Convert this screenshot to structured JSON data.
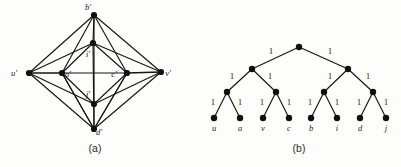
{
  "figure": {
    "panels": [
      {
        "id": "panel-a",
        "caption": "(a)",
        "type": "graph",
        "vertices": [
          {
            "id": "b'",
            "label": "b'",
            "x": 94,
            "y": 15,
            "label_x": 88,
            "label_y": 10
          },
          {
            "id": "i'",
            "label": "i'",
            "x": 93,
            "y": 43,
            "label_x": 88,
            "label_y": 57
          },
          {
            "id": "u'",
            "label": "u'",
            "x": 29,
            "y": 73,
            "label_x": 14,
            "label_y": 76
          },
          {
            "id": "a'",
            "label": "a'",
            "x": 62,
            "y": 73,
            "label_x": 68,
            "label_y": 77
          },
          {
            "id": "c'",
            "label": "c'",
            "x": 127,
            "y": 73,
            "label_x": 114,
            "label_y": 77
          },
          {
            "id": "v'",
            "label": "v'",
            "x": 161,
            "y": 72,
            "label_x": 168,
            "label_y": 76
          },
          {
            "id": "j'",
            "label": "j'",
            "x": 94,
            "y": 104,
            "label_x": 88,
            "label_y": 97
          },
          {
            "id": "d'",
            "label": "d'",
            "x": 94,
            "y": 129,
            "label_x": 99,
            "label_y": 135
          }
        ],
        "edges": [
          [
            "u'",
            "b'"
          ],
          [
            "u'",
            "d'"
          ],
          [
            "v'",
            "b'"
          ],
          [
            "v'",
            "d'"
          ],
          [
            "u'",
            "a'"
          ],
          [
            "a'",
            "c'"
          ],
          [
            "c'",
            "v'"
          ],
          [
            "u'",
            "i'"
          ],
          [
            "u'",
            "j'"
          ],
          [
            "v'",
            "i'"
          ],
          [
            "v'",
            "j'"
          ],
          [
            "b'",
            "i'"
          ],
          [
            "b'",
            "a'"
          ],
          [
            "b'",
            "c'"
          ],
          [
            "d'",
            "j'"
          ],
          [
            "d'",
            "a'"
          ],
          [
            "d'",
            "c'"
          ],
          [
            "i'",
            "a'"
          ],
          [
            "i'",
            "c'"
          ],
          [
            "j'",
            "a'"
          ],
          [
            "j'",
            "c'"
          ],
          [
            "a'",
            "d'"
          ],
          [
            "c'",
            "d'"
          ],
          [
            "b'",
            "j'"
          ],
          [
            "i'",
            "d'"
          ]
        ]
      },
      {
        "id": "panel-b",
        "caption": "(b)",
        "type": "tree",
        "edge_weight_label": "1",
        "nodes": [
          {
            "id": "root",
            "x": 299,
            "y": 47,
            "level": 0
          },
          {
            "id": "n-l",
            "x": 252,
            "y": 69,
            "level": 1
          },
          {
            "id": "n-r",
            "x": 348,
            "y": 69,
            "level": 1
          },
          {
            "id": "n-ll",
            "x": 227,
            "y": 92,
            "level": 2
          },
          {
            "id": "n-lr",
            "x": 276,
            "y": 92,
            "level": 2
          },
          {
            "id": "n-rl",
            "x": 324,
            "y": 92,
            "level": 2
          },
          {
            "id": "n-rr",
            "x": 373,
            "y": 92,
            "level": 2
          },
          {
            "id": "leaf-u",
            "x": 214,
            "y": 118,
            "level": 3,
            "label": "u",
            "label_x": 214,
            "label_y": 131
          },
          {
            "id": "leaf-a",
            "x": 240,
            "y": 118,
            "level": 3,
            "label": "a",
            "label_x": 240,
            "label_y": 131
          },
          {
            "id": "leaf-v",
            "x": 263,
            "y": 118,
            "level": 3,
            "label": "v",
            "label_x": 263,
            "label_y": 131
          },
          {
            "id": "leaf-c",
            "x": 289,
            "y": 118,
            "level": 3,
            "label": "c",
            "label_x": 289,
            "label_y": 131
          },
          {
            "id": "leaf-b",
            "x": 311,
            "y": 118,
            "level": 3,
            "label": "b",
            "label_x": 311,
            "label_y": 131
          },
          {
            "id": "leaf-i",
            "x": 337,
            "y": 118,
            "level": 3,
            "label": "i",
            "label_x": 337,
            "label_y": 131
          },
          {
            "id": "leaf-d",
            "x": 360,
            "y": 118,
            "level": 3,
            "label": "d",
            "label_x": 360,
            "label_y": 131
          },
          {
            "id": "leaf-j",
            "x": 386,
            "y": 118,
            "level": 3,
            "label": "j",
            "label_x": 386,
            "label_y": 131
          }
        ],
        "edges": [
          {
            "from": "root",
            "to": "n-l",
            "weight": "1",
            "wx": 271,
            "wy": 54
          },
          {
            "from": "root",
            "to": "n-r",
            "weight": "1",
            "wx": 330,
            "wy": 54
          },
          {
            "from": "n-l",
            "to": "n-ll",
            "weight": "1",
            "wx": 232,
            "wy": 79
          },
          {
            "from": "n-l",
            "to": "n-lr",
            "weight": "1",
            "wx": 270,
            "wy": 79
          },
          {
            "from": "n-r",
            "to": "n-rl",
            "weight": "1",
            "wx": 330,
            "wy": 79
          },
          {
            "from": "n-r",
            "to": "n-rr",
            "weight": "1",
            "wx": 368,
            "wy": 79
          },
          {
            "from": "n-ll",
            "to": "leaf-u",
            "weight": "1",
            "wx": 213,
            "wy": 105
          },
          {
            "from": "n-ll",
            "to": "leaf-a",
            "weight": "1",
            "wx": 240,
            "wy": 105
          },
          {
            "from": "n-lr",
            "to": "leaf-v",
            "weight": "1",
            "wx": 262,
            "wy": 105
          },
          {
            "from": "n-lr",
            "to": "leaf-c",
            "weight": "1",
            "wx": 289,
            "wy": 105
          },
          {
            "from": "n-rl",
            "to": "leaf-b",
            "weight": "1",
            "wx": 310,
            "wy": 105
          },
          {
            "from": "n-rl",
            "to": "leaf-i",
            "weight": "1",
            "wx": 337,
            "wy": 105
          },
          {
            "from": "n-rr",
            "to": "leaf-d",
            "weight": "1",
            "wx": 359,
            "wy": 105
          },
          {
            "from": "n-rr",
            "to": "leaf-j",
            "weight": "1",
            "wx": 386,
            "wy": 105
          }
        ]
      }
    ],
    "captions": [
      {
        "text": "(a)",
        "x": 95,
        "y": 152
      },
      {
        "text": "(b)",
        "x": 299,
        "y": 152
      }
    ],
    "colors": {
      "ink": "#101010",
      "paper": "#fdfdfc"
    }
  }
}
